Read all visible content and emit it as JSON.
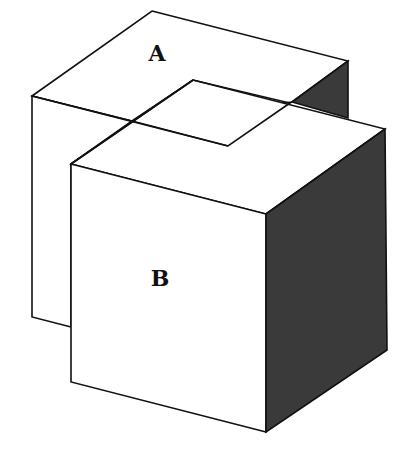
{
  "diagram": {
    "type": "overlapping-isometric-cubes",
    "colors": {
      "background": "#ffffff",
      "line": "#111111",
      "light_face": "#ffffff",
      "shaded_face": "#3a3a3a"
    },
    "shapes": [
      {
        "id": "A",
        "label": "A",
        "role": "back cube"
      },
      {
        "id": "B",
        "label": "B",
        "role": "front cube"
      }
    ],
    "labels": {
      "a": "A",
      "b": "B"
    },
    "overlap_region": "parallelogram on top faces where cube B intersects cube A"
  }
}
